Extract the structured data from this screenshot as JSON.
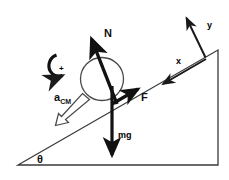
{
  "figure": {
    "background_color": "#ffffff",
    "ink_color": "#111111"
  },
  "incline": {
    "name": "inclined-plane",
    "angle_label": "θ",
    "base_color": "#3a3a3a",
    "description": "Right triangle wedge with the slope rising to the right"
  },
  "ball": {
    "name": "ball",
    "outline_color": "#4a4a4a",
    "fill": "none"
  },
  "vectors": [
    {
      "id": "normal",
      "label": "N",
      "style": "solid-filled",
      "direction": "up-left, perpendicular to incline surface"
    },
    {
      "id": "friction",
      "label": "F",
      "style": "solid-filled",
      "direction": "up the incline"
    },
    {
      "id": "weight",
      "label": "mg",
      "style": "solid-filled",
      "direction": "straight down"
    },
    {
      "id": "acceleration",
      "label": "a",
      "sublabel": "CM",
      "style": "hollow-outline",
      "direction": "down the incline"
    }
  ],
  "rotation": {
    "name": "rotation-direction-indicator",
    "sign_label": "+",
    "direction": "clockwise"
  },
  "axes": [
    {
      "id": "x-axis",
      "label": "x",
      "direction": "down the incline (lower-left)"
    },
    {
      "id": "y-axis",
      "label": "y",
      "direction": "perpendicular away from incline (upper-right)"
    }
  ]
}
